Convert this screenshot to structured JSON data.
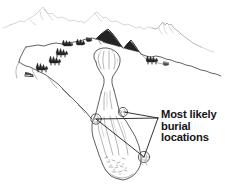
{
  "figure": {
    "name": "avalanche-path-diagram",
    "type": "line-art-illustration",
    "background_color": "#ffffff",
    "ink_color": "#3a3a3a",
    "label_color": "#141414",
    "width": 225,
    "height": 194
  },
  "callout": {
    "line1": "Most likely",
    "line2": "burial",
    "line3": "locations",
    "full_text": "Most likely burial locations",
    "leader_count": 3
  },
  "scene_elements": {
    "distant_ridge": "distant-ridgeline",
    "right_peak": "right-peak",
    "shaded_peak": "dark-shaded-peak",
    "foreground_ridge": "foreground-ridge",
    "tree_clumps": "conifer-tree-clumps",
    "start_zone": "avalanche-start-zone-bowl",
    "track": "avalanche-track-gully",
    "runout": "avalanche-runout-debris-fan",
    "burial_markers": "burial-location-markers"
  },
  "burial_markers": [
    {
      "id": "marker-left-gully",
      "label": "left gully obstacle"
    },
    {
      "id": "marker-mid-bench",
      "label": "mid bench obstacle"
    },
    {
      "id": "marker-lower-fan",
      "label": "lower fan obstacle"
    }
  ]
}
